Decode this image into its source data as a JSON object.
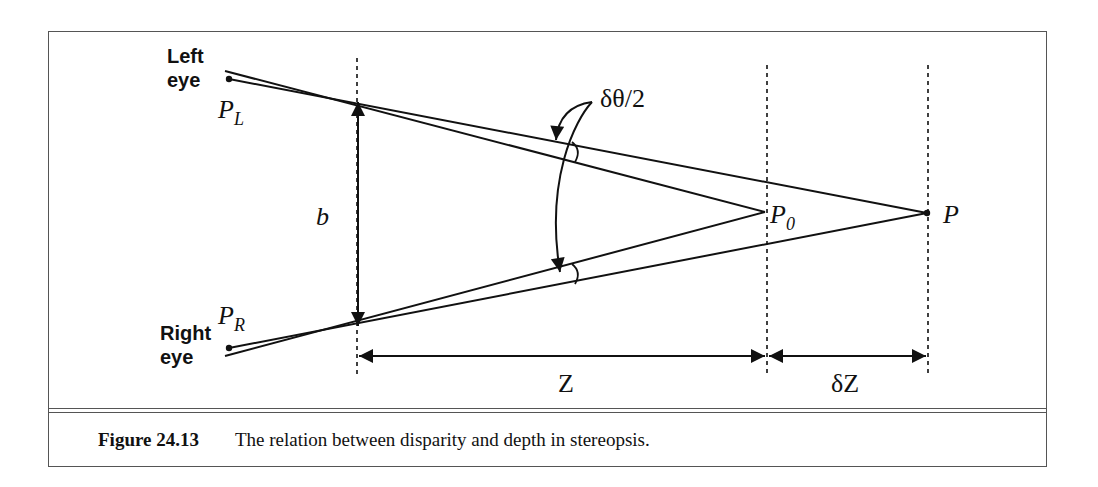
{
  "figure": {
    "labels": {
      "left_eye_line1": "Left",
      "left_eye_line2": "eye",
      "right_eye_line1": "Right",
      "right_eye_line2": "eye",
      "p_left": "P",
      "p_left_sub": "L",
      "p_right": "P",
      "p_right_sub": "R",
      "p0": "P",
      "p0_sub": "0",
      "p": "P",
      "baseline": "b",
      "angle": "δθ/2",
      "distance_z": "Z",
      "distance_dz": "δZ"
    },
    "colors": {
      "stroke": "#111111",
      "frame": "#555555",
      "background": "#ffffff"
    }
  },
  "caption": {
    "number": "Figure 24.13",
    "text": "The relation between disparity and depth in stereopsis."
  }
}
